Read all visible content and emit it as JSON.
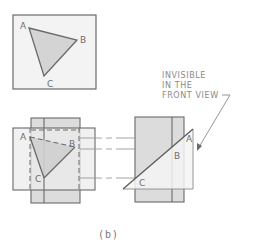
{
  "figure": {
    "caption": "(b)",
    "colors": {
      "outline": "#6a6a6a",
      "panel_fill": "#f1f1f1",
      "shaded_fill": "#d9d9d9",
      "triangle_fill": "#d4d4d4",
      "projection_line": "#9a9a9a"
    }
  },
  "top_view": {
    "vertices": {
      "a": "A",
      "b": "B",
      "c": "C"
    }
  },
  "front_view": {
    "vertices": {
      "a": "A",
      "b": "B",
      "c": "C"
    }
  },
  "side_view": {
    "vertices": {
      "a": "A",
      "b": "B",
      "c": "C"
    },
    "annotation": {
      "line1": "INVISIBLE",
      "line2": "IN THE",
      "line3": "FRONT VIEW"
    }
  }
}
